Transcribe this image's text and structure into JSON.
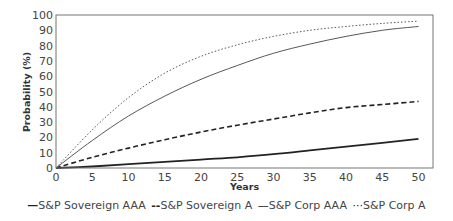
{
  "chart_data": {
    "type": "line",
    "title": "",
    "xlabel": "Years",
    "ylabel": "Probability (%)",
    "xlim": [
      0,
      52
    ],
    "ylim": [
      0,
      100
    ],
    "x_ticks": [
      0,
      5,
      10,
      15,
      20,
      25,
      30,
      35,
      40,
      45,
      50
    ],
    "y_ticks": [
      0,
      10,
      20,
      30,
      40,
      50,
      60,
      70,
      80,
      90,
      100
    ],
    "grid": false,
    "legend_position": "bottom",
    "x": [
      0,
      5,
      10,
      15,
      20,
      25,
      30,
      35,
      40,
      45,
      50
    ],
    "series": [
      {
        "name": "S&P Sovereign AAA",
        "style": "solid-thick",
        "legend_glyph": "—",
        "values": [
          0,
          1,
          2.5,
          4,
          5.5,
          7,
          9,
          11.5,
          14,
          16.5,
          19
        ]
      },
      {
        "name": "S&P Sovereign A",
        "style": "dashed",
        "legend_glyph": "--",
        "values": [
          0,
          7,
          13,
          18.5,
          23.5,
          28,
          32,
          36,
          39.5,
          41.5,
          43.5
        ]
      },
      {
        "name": "S&P Corp AAA",
        "style": "solid-thin",
        "legend_glyph": "—",
        "values": [
          0,
          18,
          34,
          47,
          58,
          67,
          75,
          81,
          86,
          90,
          92.5
        ]
      },
      {
        "name": "S&P Corp A",
        "style": "dotted",
        "legend_glyph": "···",
        "values": [
          0,
          25,
          46,
          62,
          73,
          80.5,
          86,
          90,
          92.5,
          94.5,
          96
        ]
      }
    ]
  },
  "axes": {
    "xlabel": "Years",
    "ylabel": "Probability (%)"
  },
  "legend": {
    "items": [
      {
        "glyph": "—",
        "label": "S&P Sovereign AAA"
      },
      {
        "glyph": "--",
        "label": "S&P Sovereign A"
      },
      {
        "glyph": "—",
        "label": "S&P Corp AAA"
      },
      {
        "glyph": "···",
        "label": "S&P Corp A"
      }
    ]
  }
}
